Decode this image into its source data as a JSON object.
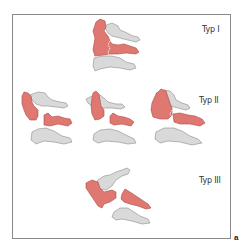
{
  "figure": {
    "panel_letter": "a",
    "colors": {
      "fracture_fragment": "#e07872",
      "intact_bone": "#d9d9d9",
      "frame": "#8a8a8a"
    },
    "groups": [
      {
        "label": "Typ I",
        "instances": 1
      },
      {
        "label": "Typ II",
        "instances": 3
      },
      {
        "label": "Typ III",
        "instances": 1
      }
    ]
  }
}
